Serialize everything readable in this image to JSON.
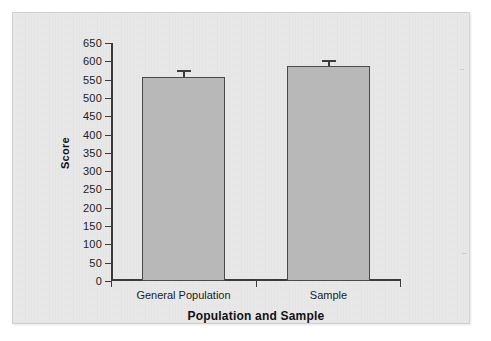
{
  "chart_data": {
    "type": "bar",
    "title": "",
    "xlabel": "Population and Sample",
    "ylabel": "Score",
    "categories": [
      "General Population",
      "Sample"
    ],
    "values": [
      557,
      587
    ],
    "errors": [
      18,
      16
    ],
    "ylim": [
      0,
      650
    ],
    "yticks": [
      0,
      50,
      100,
      150,
      200,
      250,
      300,
      350,
      400,
      450,
      500,
      550,
      600,
      650
    ],
    "ytick_labels": [
      "0",
      "50",
      "100",
      "150",
      "200",
      "250",
      "300",
      "350",
      "400",
      "450",
      "500",
      "550",
      "600",
      "650"
    ],
    "grid": false,
    "legend": null,
    "bar_fill": "#b8b8b8",
    "bar_edge": "#4a4a4a",
    "axis_color": "#3b3b3b",
    "panel_background": "#e9e9e9",
    "page_background": "#ffffff",
    "series": [
      {
        "name": "Score",
        "values": [
          557,
          587
        ],
        "errors": [
          18,
          16
        ]
      }
    ]
  },
  "axes": {
    "y_title": "Score",
    "x_title": "Population and Sample",
    "y_ticks": [
      {
        "value": 650,
        "label": "650"
      },
      {
        "value": 600,
        "label": "600"
      },
      {
        "value": 550,
        "label": "550"
      },
      {
        "value": 500,
        "label": "500"
      },
      {
        "value": 450,
        "label": "450"
      },
      {
        "value": 400,
        "label": "400"
      },
      {
        "value": 350,
        "label": "350"
      },
      {
        "value": 300,
        "label": "300"
      },
      {
        "value": 250,
        "label": "250"
      },
      {
        "value": 200,
        "label": "200"
      },
      {
        "value": 150,
        "label": "150"
      },
      {
        "value": 100,
        "label": "100"
      },
      {
        "value": 50,
        "label": "50"
      },
      {
        "value": 0,
        "label": "0"
      }
    ],
    "x_categories": [
      {
        "label": "General Population"
      },
      {
        "label": "Sample"
      }
    ]
  }
}
